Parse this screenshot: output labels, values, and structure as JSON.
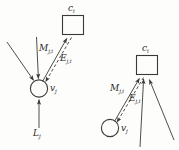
{
  "figure": {
    "type": "diagram",
    "background_color": "#fdfdfc",
    "stroke_color": "#3a3a3a",
    "text_color": "#2b2b2b"
  },
  "left_panel": {
    "node_label": {
      "base": "v",
      "sub": "j"
    },
    "factor_label": {
      "base": "c",
      "sub": "i"
    },
    "message_label": {
      "base": "M",
      "sub": "j,i"
    },
    "evidence_label": {
      "base": "E",
      "sub": "j,i"
    },
    "input_label": {
      "base": "L",
      "sub": "j"
    },
    "incoming_arrow_count": 3
  },
  "right_panel": {
    "node_label": {
      "base": "v",
      "sub": "j"
    },
    "factor_label": {
      "base": "c",
      "sub": "i"
    },
    "message_label": {
      "base": "M",
      "sub": "j,i"
    },
    "evidence_label": {
      "base": "E",
      "sub": "j,i"
    },
    "incoming_arrow_count": 3
  }
}
